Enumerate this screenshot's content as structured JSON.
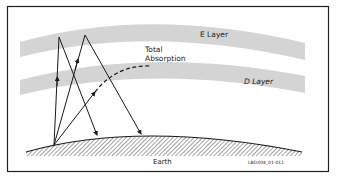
{
  "diagram": {
    "labels": {
      "e_layer": "E Layer",
      "d_layer": "D Layer",
      "absorption_line1": "Total",
      "absorption_line2": "Absorption",
      "earth": "Earth",
      "figure_id": "LBDX04_01-011"
    },
    "colors": {
      "frame": "#222222",
      "layer_fill": "#d4d4d4",
      "ray": "#1a1a1a",
      "background": "#ffffff"
    }
  }
}
